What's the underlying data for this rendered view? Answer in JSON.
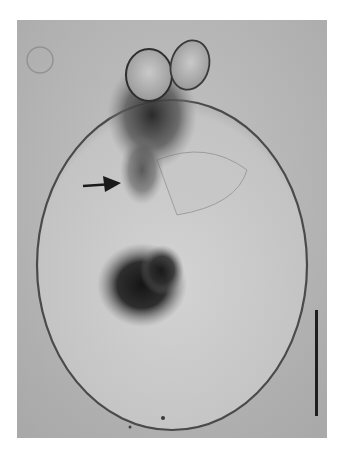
{
  "figure": {
    "type": "light micrograph",
    "annotations": {
      "arrow": {
        "direction": "right",
        "points_to": "dark fibrous region below apex"
      },
      "scale_bar": {
        "orientation": "vertical",
        "label": ""
      }
    },
    "colors": {
      "background": "#b9b9b9",
      "cell_interior": "#cbcbcb",
      "cell_membrane": "#4a4a4a",
      "dark_mass": "#1a1a1a",
      "scale_bar": "#1e1e1e"
    }
  }
}
